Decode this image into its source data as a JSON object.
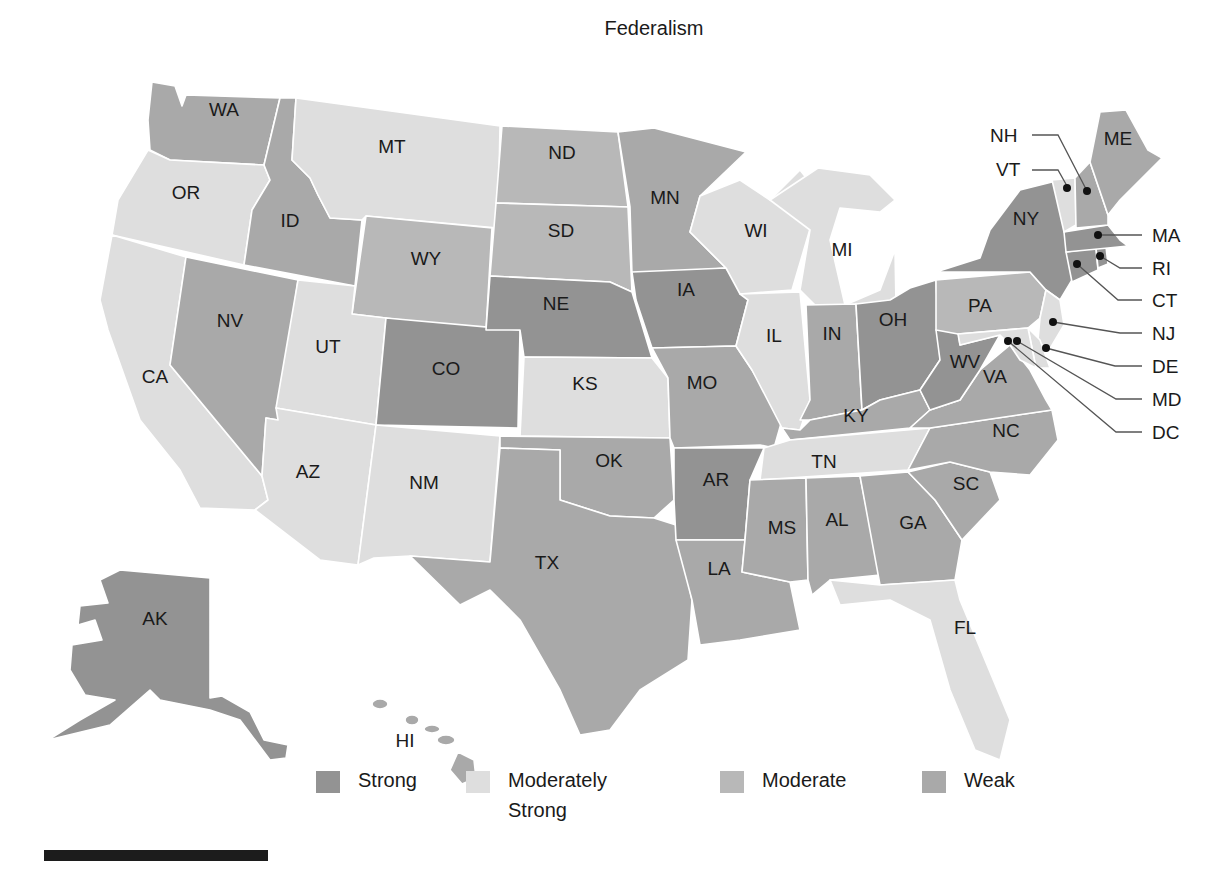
{
  "title": "Federalism",
  "colors": {
    "strong": "#939393",
    "moderately_strong": "#dedede",
    "moderate": "#b8b8b8",
    "weak": "#a9a9a9",
    "border": "#ffffff"
  },
  "legend": [
    {
      "key": "strong",
      "label": "Strong",
      "color": "#939393"
    },
    {
      "key": "moderately_strong",
      "label": "Moderately Strong",
      "color": "#dedede"
    },
    {
      "key": "moderate",
      "label": "Moderate",
      "color": "#b8b8b8"
    },
    {
      "key": "weak",
      "label": "Weak",
      "color": "#a9a9a9"
    }
  ],
  "states": {
    "WA": "weak",
    "OR": "moderately_strong",
    "CA": "moderately_strong",
    "ID": "weak",
    "NV": "weak",
    "MT": "moderately_strong",
    "WY": "moderate",
    "UT": "moderately_strong",
    "AZ": "moderately_strong",
    "CO": "strong",
    "NM": "moderately_strong",
    "ND": "moderate",
    "SD": "moderate",
    "NE": "strong",
    "KS": "moderately_strong",
    "OK": "weak",
    "TX": "weak",
    "MN": "weak",
    "IA": "strong",
    "MO": "weak",
    "AR": "strong",
    "LA": "weak",
    "WI": "moderately_strong",
    "IL": "moderately_strong",
    "MI": "moderately_strong",
    "IN": "weak",
    "OH": "strong",
    "KY": "weak",
    "TN": "moderately_strong",
    "MS": "weak",
    "AL": "weak",
    "GA": "weak",
    "FL": "moderately_strong",
    "SC": "weak",
    "NC": "weak",
    "VA": "weak",
    "WV": "strong",
    "PA": "moderate",
    "NY": "strong",
    "NJ": "moderately_strong",
    "DE": "moderately_strong",
    "MD": "moderately_strong",
    "DC": "moderately_strong",
    "CT": "strong",
    "RI": "strong",
    "MA": "strong",
    "VT": "moderately_strong",
    "NH": "weak",
    "ME": "weak",
    "AK": "strong",
    "HI": "weak"
  },
  "labels": {
    "WA": "WA",
    "OR": "OR",
    "CA": "CA",
    "ID": "ID",
    "NV": "NV",
    "MT": "MT",
    "WY": "WY",
    "UT": "UT",
    "AZ": "AZ",
    "CO": "CO",
    "NM": "NM",
    "ND": "ND",
    "SD": "SD",
    "NE": "NE",
    "KS": "KS",
    "OK": "OK",
    "TX": "TX",
    "MN": "MN",
    "IA": "IA",
    "MO": "MO",
    "AR": "AR",
    "LA": "LA",
    "WI": "WI",
    "IL": "IL",
    "MI": "MI",
    "IN": "IN",
    "OH": "OH",
    "KY": "KY",
    "TN": "TN",
    "MS": "MS",
    "AL": "AL",
    "GA": "GA",
    "FL": "FL",
    "SC": "SC",
    "NC": "NC",
    "VA": "VA",
    "WV": "WV",
    "PA": "PA",
    "NY": "NY",
    "NJ": "NJ",
    "DE": "DE",
    "MD": "MD",
    "DC": "DC",
    "CT": "CT",
    "RI": "RI",
    "MA": "MA",
    "VT": "VT",
    "NH": "NH",
    "ME": "ME",
    "AK": "AK",
    "HI": "HI"
  }
}
